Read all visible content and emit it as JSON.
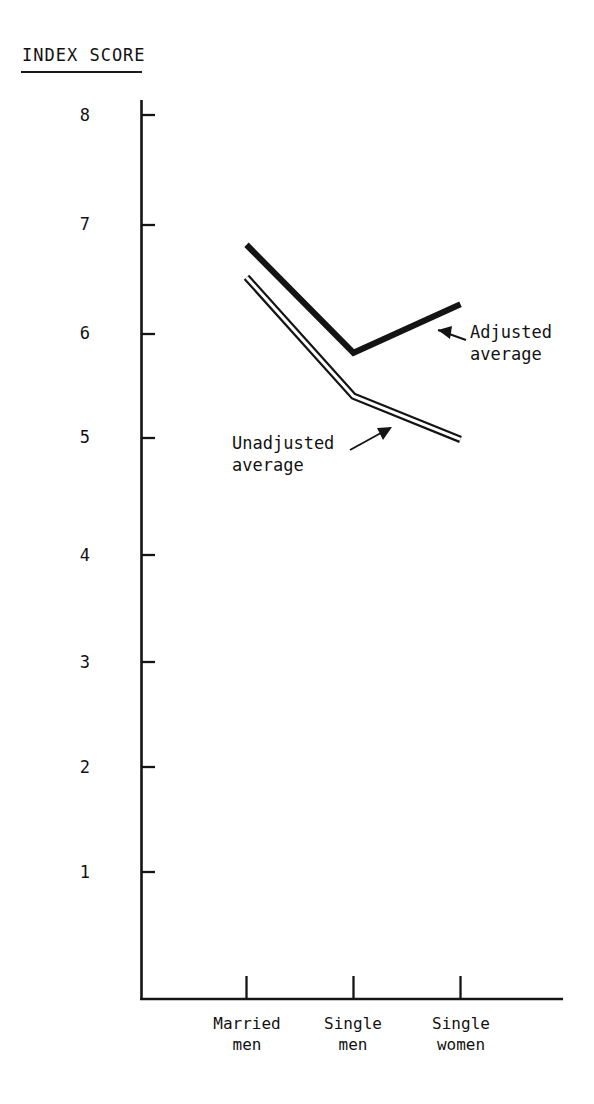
{
  "chart_data": {
    "type": "line",
    "title": "INDEX SCORE",
    "xlabel": "",
    "ylabel": "INDEX SCORE",
    "categories": [
      "Married\nmen",
      "Single\nmen",
      "Single\nwomen"
    ],
    "category_labels_flat": [
      "Married men",
      "Single men",
      "Single women"
    ],
    "ytick_labels": [
      "8",
      "7",
      "6",
      "5",
      "4",
      "3",
      "2",
      "1"
    ],
    "ytick_values": [
      8,
      7,
      6,
      5,
      4,
      3,
      2,
      1
    ],
    "ylim": [
      0.55,
      8.35
    ],
    "grid": false,
    "legend_position": "inline-annotations",
    "series": [
      {
        "name": "Adjusted average",
        "style": "solid-thick",
        "color": "#111111",
        "values": [
          6.8,
          5.8,
          6.25
        ]
      },
      {
        "name": "Unadjusted average",
        "style": "double-outline",
        "color": "#111111",
        "values": [
          6.5,
          5.4,
          5.0
        ]
      }
    ],
    "annotations": [
      {
        "id": "adjusted-annotation",
        "text": "Adjusted\naverage",
        "line1": "Adjusted",
        "line2": "average",
        "arrow": "points up-left to Adjusted average line"
      },
      {
        "id": "unadjusted-annotation",
        "text": "Unadjusted\naverage",
        "line1": "Unadjusted",
        "line2": "average",
        "arrow": "points up-right to Unadjusted average line"
      }
    ]
  },
  "axes": {
    "y_axis_name": "y-axis",
    "x_axis_name": "x-axis"
  },
  "colors": {
    "ink": "#111111",
    "paper": "#ffffff"
  }
}
